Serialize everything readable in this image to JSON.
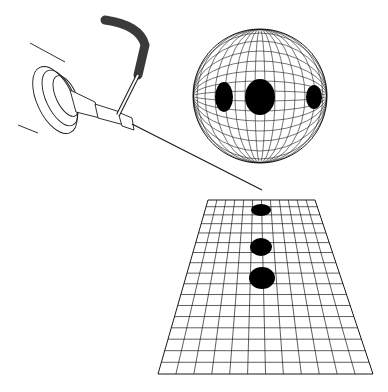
{
  "figure": {
    "type": "technical-illustration",
    "elements": [
      "needle-instrument",
      "spherical-grid",
      "planar-grid"
    ],
    "sphere": {
      "spots": 3
    },
    "plane": {
      "spots": 3
    }
  },
  "colors": {
    "line": "#1a1a1a",
    "fill": "#000000",
    "background": "#ffffff",
    "hose": "#3a3a3a"
  }
}
